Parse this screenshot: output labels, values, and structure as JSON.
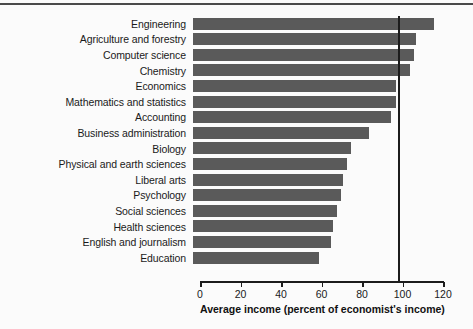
{
  "chart_data": {
    "type": "bar",
    "orientation": "horizontal",
    "title": "",
    "xlabel": "Average income (percent of economist's income)",
    "ylabel": "",
    "xlim": [
      0,
      124
    ],
    "xticks": [
      0,
      20,
      40,
      60,
      80,
      100,
      120
    ],
    "grid": false,
    "reference_line": 100,
    "bar_color": "#5a5a5a",
    "categories": [
      "Engineering",
      "Agriculture and forestry",
      "Computer science",
      "Chemistry",
      "Economics",
      "Mathematics and statistics",
      "Accounting",
      "Business administration",
      "Biology",
      "Physical and earth sciences",
      "Liberal arts",
      "Psychology",
      "Social sciences",
      "Health sciences",
      "English and journalism",
      "Education"
    ],
    "values": [
      119,
      110,
      109,
      107,
      100,
      100,
      98,
      87,
      78,
      76,
      74,
      73,
      71,
      69,
      68,
      62
    ]
  }
}
